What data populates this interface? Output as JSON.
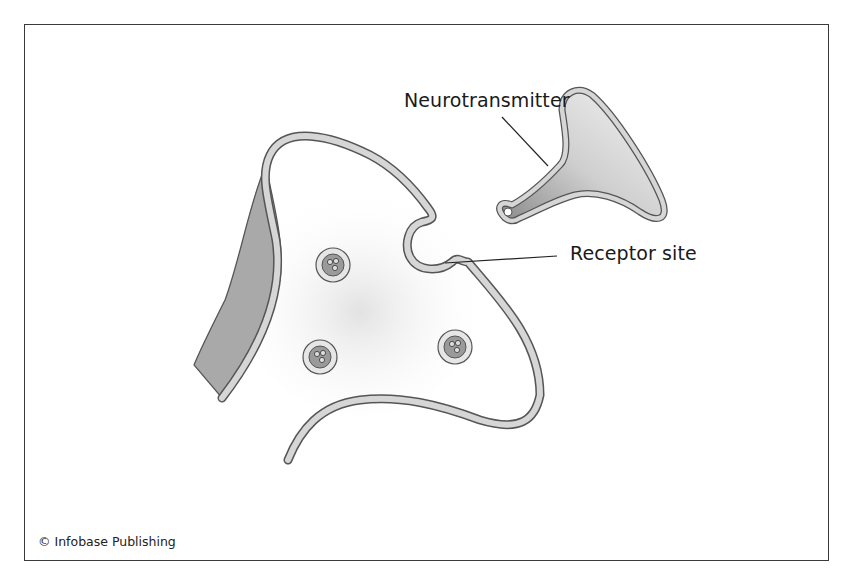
{
  "diagram": {
    "type": "synapse-illustration",
    "labels": {
      "neurotransmitter": "Neurotransmitter",
      "receptor_site": "Receptor site"
    },
    "credit": "© Infobase Publishing",
    "colors": {
      "outline": "#555555",
      "membrane_fill": "#d6d6d6",
      "axon_fill": "#a9a9a9",
      "vesicle_fill": "#9a9a9a",
      "frame": "#3a3a3a"
    },
    "vesicles": [
      {
        "cx": 333,
        "cy": 265
      },
      {
        "cx": 320,
        "cy": 357
      },
      {
        "cx": 455,
        "cy": 347
      }
    ]
  }
}
